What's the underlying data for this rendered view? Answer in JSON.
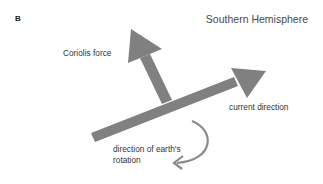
{
  "panel": {
    "label": "B",
    "title": "Southern Hemisphere"
  },
  "labels": {
    "coriolis": "Coriolis force",
    "current": "current direction",
    "rotation_line1": "direction of earth's",
    "rotation_line2": "rotation"
  },
  "colors": {
    "arrow": "#808080",
    "text": "#333333",
    "background": "#ffffff"
  }
}
